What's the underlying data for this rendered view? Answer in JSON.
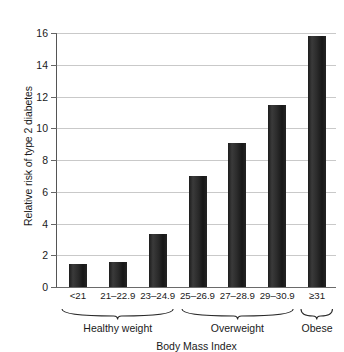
{
  "chart_data": {
    "type": "bar",
    "title": "",
    "xlabel": "Body Mass Index",
    "ylabel": "Relative risk of type 2 diabetes",
    "categories": [
      "<21",
      "21–22.9",
      "23–24.9",
      "25–26.9",
      "27–28.9",
      "29–30.9",
      "≥31"
    ],
    "values": [
      1.45,
      1.6,
      3.35,
      7.0,
      9.05,
      11.45,
      15.8
    ],
    "ylim": [
      0,
      16
    ],
    "yticks": [
      0,
      2,
      4,
      6,
      8,
      10,
      12,
      14,
      16
    ],
    "ytick_labels": [
      "0",
      "2",
      "4",
      "6",
      "8",
      "10",
      "12",
      "14",
      "16"
    ],
    "grid": true,
    "legend": "none",
    "bar_color": "#262626",
    "grid_color": "#c9c9c9",
    "axis_color": "#555555",
    "groups": [
      {
        "label": "Healthy weight",
        "from": 0,
        "to": 2
      },
      {
        "label": "Overweight",
        "from": 3,
        "to": 5
      },
      {
        "label": "Obese",
        "from": 6,
        "to": 6
      }
    ]
  }
}
